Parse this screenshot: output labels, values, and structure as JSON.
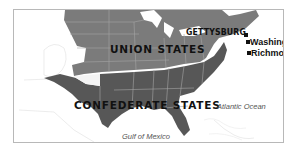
{
  "map": {
    "colors": {
      "union": "#7b7b7b",
      "confederate": "#575757",
      "other_land": "#ffffff",
      "state_borders": "#a9a9a9",
      "water": "#ffffff",
      "frame_border": "#b8b8b8"
    },
    "regions": [
      {
        "name": "union",
        "label": "UNION STATES"
      },
      {
        "name": "confederate",
        "label": "CONFEDERATE STATES"
      }
    ],
    "places": [
      {
        "name": "gettysburg",
        "label": "GETTYSBURG",
        "marker": true
      },
      {
        "name": "washington",
        "label": "Washington",
        "marker": true
      },
      {
        "name": "richmond",
        "label": "Richmond",
        "marker": true
      }
    ],
    "water_bodies": [
      {
        "name": "atlantic",
        "label": "Atlantic Ocean"
      },
      {
        "name": "gulf",
        "label": "Gulf of Mexico"
      }
    ]
  }
}
